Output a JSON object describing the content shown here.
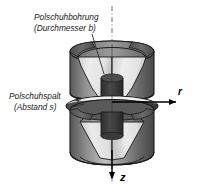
{
  "figure": {
    "title_visible": false,
    "language": "de",
    "background_color": "#ffffff",
    "outline_color": "#1a1a1a"
  },
  "annotations": {
    "bore": {
      "line1": "Polschuhbohrung",
      "line2": "(Durchmesser b)",
      "name": "pole-shoe-bore-label"
    },
    "gap": {
      "line1": "Polschuhspalt",
      "line2": "(Abstand s)",
      "name": "pole-shoe-gap-label"
    },
    "phi_symbol": "φ"
  },
  "axes": {
    "radial": {
      "label": "r",
      "direction": "right",
      "name": "r-axis"
    },
    "axial": {
      "label": "z",
      "direction": "down",
      "name": "z-axis"
    },
    "center_line_style": "dash-dot"
  },
  "colors": {
    "body_dark": "#4a4a4a",
    "body_mid": "#7d7d7d",
    "body_light": "#c9c9c9",
    "body_lighter": "#e2e2e2",
    "cut_face": "#5c5c5c",
    "cut_face_dark": "#333333",
    "highlight": "#f0f0f0",
    "stroke": "#1a1a1a",
    "text": "#1a1a1a"
  },
  "parts": [
    {
      "name": "upper-pole-shoe",
      "description": "upper conical pole piece with bore"
    },
    {
      "name": "lower-pole-shoe",
      "description": "lower conical pole piece with bore"
    },
    {
      "name": "gap-region",
      "description": "air gap between pole shoes"
    },
    {
      "name": "bore-region",
      "description": "central cylindrical bore"
    }
  ]
}
